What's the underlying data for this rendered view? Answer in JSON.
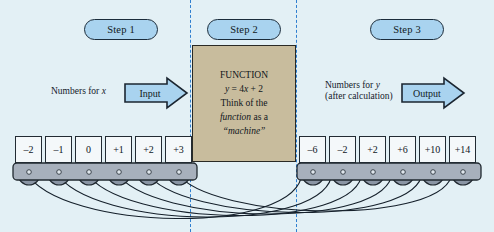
{
  "diagram": {
    "background_color": "#e3f0f5",
    "steps": [
      {
        "label": "Step 1",
        "x": 84,
        "y": 19
      },
      {
        "label": "Step 2",
        "x": 207,
        "y": 19
      },
      {
        "label": "Step 3",
        "x": 370,
        "y": 19
      }
    ],
    "divider_x": [
      190,
      296
    ],
    "input_side": {
      "caption": "Numbers for x",
      "caption_italic_tail": "x",
      "arrow_label": "Input",
      "arrow_color": "#a9d3ef"
    },
    "output_side": {
      "caption_line1": "Numbers for y",
      "caption_line2": "(after calculation)",
      "arrow_label": "Output",
      "arrow_color": "#a9d3ef"
    },
    "function_box": {
      "background_color": "#c8bc9d",
      "line1": "FUNCTION",
      "line2": "y = 4x + 2",
      "line3": "Think of the",
      "line4_italic": "function",
      "line4_rest": " as a",
      "line5_italic": "“machine”"
    },
    "input_tiles": [
      "–2",
      "–1",
      "0",
      "+1",
      "+2",
      "+3"
    ],
    "output_tiles": [
      "–6",
      "–2",
      "+2",
      "+6",
      "+10",
      "+14"
    ],
    "belt_color": "#a7b0bc",
    "roller_color": "#8a95a4"
  },
  "chart_data": {
    "type": "table",
    "title": "FUNCTION y = 4x + 2",
    "xlabel": "Numbers for x (Input)",
    "ylabel": "Numbers for y (after calculation, Output)",
    "categories": [
      "-2",
      "-1",
      "0",
      "+1",
      "+2",
      "+3"
    ],
    "series": [
      {
        "name": "x (input)",
        "values": [
          -2,
          -1,
          0,
          1,
          2,
          3
        ]
      },
      {
        "name": "y = 4x + 2",
        "values": [
          -6,
          -2,
          2,
          6,
          10,
          14
        ]
      }
    ],
    "annotations": [
      "Step 1",
      "Step 2",
      "Step 3",
      "Input",
      "Output",
      "Think of the function as a “machine”"
    ],
    "grid": false,
    "legend": "none"
  }
}
